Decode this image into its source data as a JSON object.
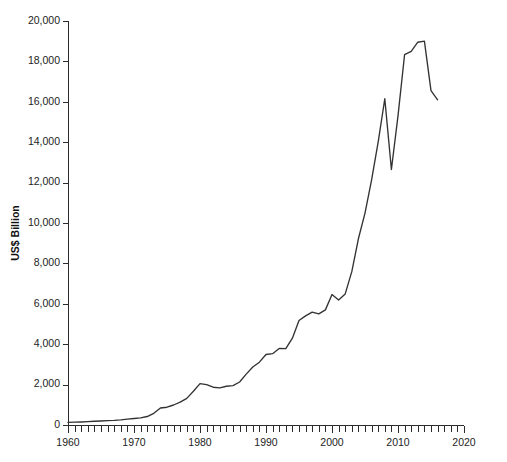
{
  "chart_data": {
    "type": "line",
    "title": "",
    "subtitle": "",
    "xlabel": "",
    "ylabel": "US$ Billion",
    "xlim": [
      1960,
      2020
    ],
    "ylim": [
      0,
      20000
    ],
    "grid": false,
    "legend": null,
    "legend_position": "none",
    "line_color": "#333333",
    "axis_color": "#2b2b2b",
    "y_ticks": [
      0,
      2000,
      4000,
      6000,
      8000,
      10000,
      12000,
      14000,
      16000,
      18000,
      20000
    ],
    "y_tick_labels": [
      "0",
      "2,000",
      "4,000",
      "6,000",
      "8,000",
      "10,000",
      "12,000",
      "14,000",
      "16,000",
      "18,000",
      "20,000"
    ],
    "x_major_ticks": [
      1960,
      1970,
      1980,
      1990,
      2000,
      2010,
      2020
    ],
    "x_major_tick_labels": [
      "1960",
      "1970",
      "1980",
      "1990",
      "2000",
      "2010",
      "2020"
    ],
    "x_minor_tick_step": 1,
    "series": [
      {
        "name": "World merchandise exports",
        "x": [
          1960,
          1961,
          1962,
          1963,
          1964,
          1965,
          1966,
          1967,
          1968,
          1969,
          1970,
          1971,
          1972,
          1973,
          1974,
          1975,
          1976,
          1977,
          1978,
          1979,
          1980,
          1981,
          1982,
          1983,
          1984,
          1985,
          1986,
          1987,
          1988,
          1989,
          1990,
          1991,
          1992,
          1993,
          1994,
          1995,
          1996,
          1997,
          1998,
          1999,
          2000,
          2001,
          2002,
          2003,
          2004,
          2005,
          2006,
          2007,
          2008,
          2009,
          2010,
          2011,
          2012,
          2013,
          2014,
          2015,
          2016
        ],
        "values": [
          130,
          140,
          150,
          165,
          185,
          200,
          220,
          230,
          255,
          290,
          320,
          355,
          420,
          580,
          840,
          880,
          990,
          1130,
          1320,
          1670,
          2050,
          2000,
          1870,
          1840,
          1920,
          1950,
          2130,
          2520,
          2870,
          3110,
          3490,
          3530,
          3790,
          3780,
          4300,
          5170,
          5400,
          5590,
          5500,
          5700,
          6460,
          6190,
          6490,
          7590,
          9220,
          10490,
          12130,
          14020,
          16150,
          12650,
          15300,
          18340,
          18500,
          18950,
          19000,
          16550,
          16100
        ]
      }
    ]
  },
  "axis_title": {
    "y": "US$ Billion"
  }
}
